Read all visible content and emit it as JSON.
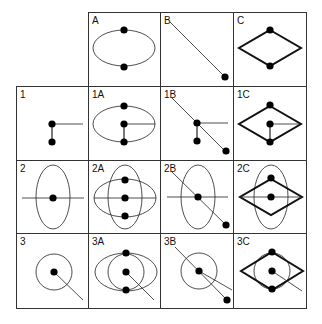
{
  "diagram": {
    "title": "",
    "grid": {
      "cols_x": [
        16,
        88,
        160,
        233,
        306
      ],
      "rows_y": [
        12,
        86,
        160,
        233,
        308
      ],
      "line_color": "#333333"
    },
    "colors": {
      "stroke": "#222222",
      "dot": "#000000",
      "thick": "#111111"
    },
    "cells": [
      {
        "id": "A",
        "label": "A",
        "col": 1,
        "row": 0,
        "shapes": [
          {
            "type": "ellipse",
            "cx": 124,
            "cy": 48,
            "rx": 31,
            "ry": 18,
            "w": 0.8
          },
          {
            "type": "dot",
            "cx": 124,
            "cy": 30
          },
          {
            "type": "dot",
            "cx": 124,
            "cy": 67
          }
        ]
      },
      {
        "id": "B",
        "label": "B",
        "col": 2,
        "row": 0,
        "shapes": [
          {
            "type": "line",
            "x1": 170,
            "y1": 22,
            "x2": 225,
            "y2": 77,
            "w": 0.8
          },
          {
            "type": "dot",
            "cx": 225,
            "cy": 77
          }
        ]
      },
      {
        "id": "C",
        "label": "C",
        "col": 3,
        "row": 0,
        "shapes": [
          {
            "type": "diamond",
            "cx": 270,
            "cy": 48,
            "hw": 31,
            "hh": 18,
            "w": 2
          },
          {
            "type": "dot",
            "cx": 270,
            "cy": 30
          },
          {
            "type": "dot",
            "cx": 270,
            "cy": 66
          }
        ]
      },
      {
        "id": "1",
        "label": "1",
        "col": 0,
        "row": 1,
        "shapes": [
          {
            "type": "line",
            "x1": 52,
            "y1": 124,
            "x2": 83,
            "y2": 124,
            "w": 0.8
          },
          {
            "type": "line",
            "x1": 52,
            "y1": 124,
            "x2": 52,
            "y2": 142,
            "w": 1.2
          },
          {
            "type": "dot",
            "cx": 52,
            "cy": 124
          },
          {
            "type": "dot",
            "cx": 52,
            "cy": 142
          }
        ]
      },
      {
        "id": "1A",
        "label": "1A",
        "col": 1,
        "row": 1,
        "shapes": [
          {
            "type": "ellipse",
            "cx": 124,
            "cy": 124,
            "rx": 31,
            "ry": 18,
            "w": 0.8
          },
          {
            "type": "line",
            "x1": 124,
            "y1": 124,
            "x2": 155,
            "y2": 124,
            "w": 0.8
          },
          {
            "type": "line",
            "x1": 124,
            "y1": 124,
            "x2": 124,
            "y2": 142,
            "w": 1.2
          },
          {
            "type": "dot",
            "cx": 124,
            "cy": 106
          },
          {
            "type": "dot",
            "cx": 124,
            "cy": 124
          },
          {
            "type": "dot",
            "cx": 124,
            "cy": 142
          }
        ]
      },
      {
        "id": "1B",
        "label": "1B",
        "col": 2,
        "row": 1,
        "shapes": [
          {
            "type": "line",
            "x1": 172,
            "y1": 98,
            "x2": 226,
            "y2": 152,
            "w": 0.8
          },
          {
            "type": "line",
            "x1": 197,
            "y1": 123,
            "x2": 228,
            "y2": 123,
            "w": 0.8
          },
          {
            "type": "line",
            "x1": 197,
            "y1": 123,
            "x2": 197,
            "y2": 141,
            "w": 1.2
          },
          {
            "type": "dot",
            "cx": 197,
            "cy": 123
          },
          {
            "type": "dot",
            "cx": 197,
            "cy": 141
          },
          {
            "type": "dot",
            "cx": 226,
            "cy": 151
          }
        ]
      },
      {
        "id": "1C",
        "label": "1C",
        "col": 3,
        "row": 1,
        "shapes": [
          {
            "type": "diamond",
            "cx": 270,
            "cy": 124,
            "hw": 31,
            "hh": 18,
            "w": 2
          },
          {
            "type": "line",
            "x1": 270,
            "y1": 124,
            "x2": 299,
            "y2": 124,
            "w": 0.8
          },
          {
            "type": "line",
            "x1": 270,
            "y1": 124,
            "x2": 270,
            "y2": 142,
            "w": 1.2
          },
          {
            "type": "dot",
            "cx": 270,
            "cy": 105
          },
          {
            "type": "dot",
            "cx": 270,
            "cy": 124
          },
          {
            "type": "dot",
            "cx": 270,
            "cy": 142
          }
        ]
      },
      {
        "id": "2",
        "label": "2",
        "col": 0,
        "row": 2,
        "shapes": [
          {
            "type": "ellipse",
            "cx": 53,
            "cy": 197,
            "rx": 17,
            "ry": 32,
            "w": 0.8
          },
          {
            "type": "line",
            "x1": 22,
            "y1": 198,
            "x2": 84,
            "y2": 198,
            "w": 0.8
          },
          {
            "type": "dot",
            "cx": 53,
            "cy": 198
          }
        ]
      },
      {
        "id": "2A",
        "label": "2A",
        "col": 1,
        "row": 2,
        "shapes": [
          {
            "type": "ellipse",
            "cx": 125,
            "cy": 198,
            "rx": 31,
            "ry": 19,
            "w": 0.8
          },
          {
            "type": "ellipse",
            "cx": 125,
            "cy": 197,
            "rx": 17,
            "ry": 32,
            "w": 0.8
          },
          {
            "type": "line",
            "x1": 94,
            "y1": 198,
            "x2": 156,
            "y2": 198,
            "w": 0.8
          },
          {
            "type": "dot",
            "cx": 125,
            "cy": 180
          },
          {
            "type": "dot",
            "cx": 125,
            "cy": 198
          },
          {
            "type": "dot",
            "cx": 125,
            "cy": 216
          }
        ]
      },
      {
        "id": "2B",
        "label": "2B",
        "col": 2,
        "row": 2,
        "shapes": [
          {
            "type": "ellipse",
            "cx": 198,
            "cy": 197,
            "rx": 17,
            "ry": 32,
            "w": 0.8
          },
          {
            "type": "line",
            "x1": 167,
            "y1": 197,
            "x2": 228,
            "y2": 197,
            "w": 0.8
          },
          {
            "type": "line",
            "x1": 172,
            "y1": 172,
            "x2": 226,
            "y2": 225,
            "w": 0.8
          },
          {
            "type": "dot",
            "cx": 198,
            "cy": 197
          },
          {
            "type": "dot",
            "cx": 226,
            "cy": 225
          }
        ]
      },
      {
        "id": "2C",
        "label": "2C",
        "col": 3,
        "row": 2,
        "shapes": [
          {
            "type": "ellipse",
            "cx": 271,
            "cy": 197,
            "rx": 17,
            "ry": 32,
            "w": 0.8
          },
          {
            "type": "diamond",
            "cx": 271,
            "cy": 197,
            "hw": 31,
            "hh": 18,
            "w": 2
          },
          {
            "type": "line",
            "x1": 240,
            "y1": 197,
            "x2": 302,
            "y2": 197,
            "w": 0.8
          },
          {
            "type": "dot",
            "cx": 271,
            "cy": 178
          },
          {
            "type": "dot",
            "cx": 271,
            "cy": 197
          }
        ]
      },
      {
        "id": "3",
        "label": "3",
        "col": 0,
        "row": 3,
        "shapes": [
          {
            "type": "circle",
            "cx": 54,
            "cy": 272,
            "r": 18,
            "w": 0.8
          },
          {
            "type": "line",
            "x1": 54,
            "y1": 272,
            "x2": 83,
            "y2": 300,
            "w": 0.8
          },
          {
            "type": "dot",
            "cx": 54,
            "cy": 272
          }
        ]
      },
      {
        "id": "3A",
        "label": "3A",
        "col": 1,
        "row": 3,
        "shapes": [
          {
            "type": "ellipse",
            "cx": 126,
            "cy": 272,
            "rx": 31,
            "ry": 19,
            "w": 0.8
          },
          {
            "type": "circle",
            "cx": 126,
            "cy": 272,
            "r": 18,
            "w": 0.8
          },
          {
            "type": "line",
            "x1": 126,
            "y1": 272,
            "x2": 154,
            "y2": 300,
            "w": 0.8
          },
          {
            "type": "dot",
            "cx": 126,
            "cy": 253
          },
          {
            "type": "dot",
            "cx": 126,
            "cy": 272
          },
          {
            "type": "dot",
            "cx": 126,
            "cy": 290
          }
        ]
      },
      {
        "id": "3B",
        "label": "3B",
        "col": 2,
        "row": 3,
        "shapes": [
          {
            "type": "circle",
            "cx": 199,
            "cy": 271,
            "r": 18,
            "w": 0.8
          },
          {
            "type": "line",
            "x1": 175,
            "y1": 247,
            "x2": 227,
            "y2": 300,
            "w": 0.8
          },
          {
            "type": "line",
            "x1": 199,
            "y1": 271,
            "x2": 232,
            "y2": 290,
            "w": 0.8
          },
          {
            "type": "dot",
            "cx": 199,
            "cy": 271
          },
          {
            "type": "dot",
            "cx": 227,
            "cy": 300
          }
        ]
      },
      {
        "id": "3C",
        "label": "3C",
        "col": 3,
        "row": 3,
        "shapes": [
          {
            "type": "circle",
            "cx": 272,
            "cy": 271,
            "r": 18,
            "w": 0.8
          },
          {
            "type": "diamond",
            "cx": 272,
            "cy": 271,
            "hw": 31,
            "hh": 19,
            "w": 2
          },
          {
            "type": "line",
            "x1": 272,
            "y1": 271,
            "x2": 302,
            "y2": 291,
            "w": 0.8
          },
          {
            "type": "dot",
            "cx": 272,
            "cy": 252
          },
          {
            "type": "dot",
            "cx": 272,
            "cy": 271
          },
          {
            "type": "dot",
            "cx": 272,
            "cy": 289
          }
        ]
      }
    ]
  }
}
